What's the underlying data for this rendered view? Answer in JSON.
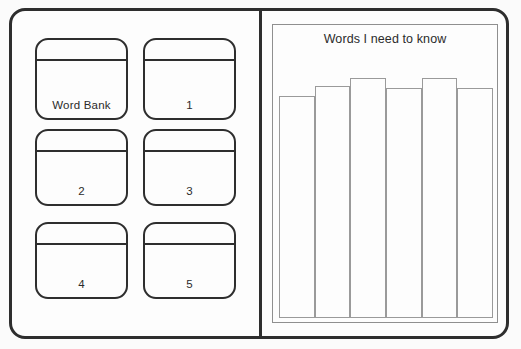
{
  "worksheet": {
    "title": "Vocabulary worksheet",
    "left_panel": {
      "name": "word-bank-grid",
      "cards": [
        {
          "label": "Word Bank"
        },
        {
          "label": "1"
        },
        {
          "label": "2"
        },
        {
          "label": "3"
        },
        {
          "label": "4"
        },
        {
          "label": "5"
        }
      ]
    },
    "right_panel": {
      "name": "words-chart-panel",
      "chart_title": "Words I need to know"
    }
  },
  "colors": {
    "frame_stroke": "#2e2e2e",
    "card_stroke": "#2e2e2e",
    "chart_stroke": "#8f8f8f",
    "bar_stroke": "#9a9a9a",
    "page_background": "#fbfbfb",
    "paper_background": "#fdfdfd",
    "text": "#2b2b2b"
  },
  "chart_data": {
    "type": "bar",
    "title": "Words I need to know",
    "xlabel": "",
    "ylabel": "",
    "categories": [
      "1",
      "2",
      "3",
      "4",
      "5",
      "6"
    ],
    "values": [
      83,
      87,
      90,
      86,
      90,
      86
    ],
    "ylim": [
      0,
      100
    ],
    "grid": false,
    "legend": null,
    "tick_labels": {
      "x": [],
      "y": []
    }
  }
}
